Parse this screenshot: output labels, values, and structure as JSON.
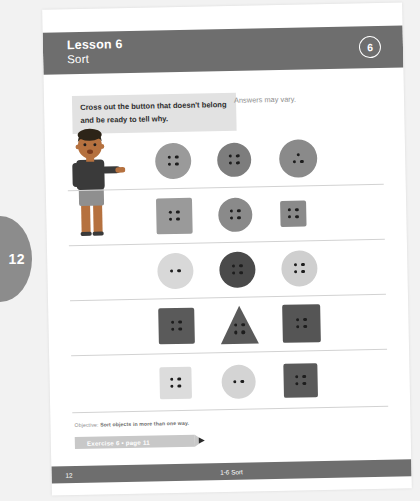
{
  "page_tab": {
    "number": "12"
  },
  "header": {
    "lesson_title": "Lesson 6",
    "lesson_subtitle": "Sort",
    "lesson_badge": "6"
  },
  "instruction": {
    "text": "Cross out the button that doesn't belong and be ready to tell why.",
    "answers_note": "Answers may vary."
  },
  "character": {
    "name": "boy-pointing-illustration",
    "skin_color": "#b5713f",
    "hair_color": "#2d2418",
    "shirt_color": "#3a3a3a",
    "shorts_color": "#8f8f8f"
  },
  "exercises": [
    {
      "row": 1,
      "buttons": [
        {
          "shape": "circle",
          "size": 36,
          "color": "#9a9a9a",
          "holes": 4
        },
        {
          "shape": "circle",
          "size": 34,
          "color": "#7d7d7d",
          "holes": 4
        },
        {
          "shape": "circle",
          "size": 38,
          "color": "#8a8a8a",
          "holes": 3
        }
      ]
    },
    {
      "row": 2,
      "buttons": [
        {
          "shape": "square",
          "size": 36,
          "color": "#9a9a9a",
          "holes": 4
        },
        {
          "shape": "circle",
          "size": 34,
          "color": "#8a8a8a",
          "holes": 4
        },
        {
          "shape": "square",
          "size": 26,
          "color": "#8a8a8a",
          "holes": 4
        }
      ]
    },
    {
      "row": 3,
      "buttons": [
        {
          "shape": "circle",
          "size": 36,
          "color": "#d8d8d8",
          "holes": 2
        },
        {
          "shape": "circle",
          "size": 36,
          "color": "#4a4a4a",
          "holes": 4
        },
        {
          "shape": "circle",
          "size": 36,
          "color": "#cfcfcf",
          "holes": 4
        }
      ]
    },
    {
      "row": 4,
      "buttons": [
        {
          "shape": "square",
          "size": 36,
          "color": "#5a5a5a",
          "holes": 4
        },
        {
          "shape": "triangle",
          "size": 38,
          "color": "#5a5a5a",
          "holes": 4
        },
        {
          "shape": "square",
          "size": 38,
          "color": "#555555",
          "holes": 4
        }
      ]
    },
    {
      "row": 5,
      "buttons": [
        {
          "shape": "square",
          "size": 32,
          "color": "#dcdcdc",
          "holes": 4
        },
        {
          "shape": "circle",
          "size": 34,
          "color": "#d4d4d4",
          "holes": 2
        },
        {
          "shape": "square",
          "size": 34,
          "color": "#5a5a5a",
          "holes": 4
        }
      ]
    }
  ],
  "footer": {
    "objective_label": "Objective:",
    "objective_text": "Sort objects in more than one way.",
    "exercise_banner": "Exercise 6 • page 11",
    "page_number": "12",
    "center_text": "1-6 Sort"
  },
  "colors": {
    "header_bar": "#6e6e6e",
    "footer_bar": "#6e6e6e",
    "instruction_bg": "#e2e2e2",
    "banner": "#c8c8c8",
    "page_tab": "#8c8c8c",
    "backdrop": "#f2f2f2"
  }
}
